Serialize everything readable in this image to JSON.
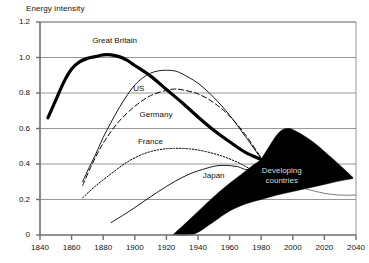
{
  "chart_data": {
    "type": "line",
    "title": "Energy intensity",
    "xlabel": "",
    "ylabel": "",
    "xlim": [
      1840,
      2040
    ],
    "ylim": [
      0,
      1.2
    ],
    "grid": true,
    "legend_position": "inline-labels",
    "xticks": [
      "1840",
      "1860",
      "1880",
      "1900",
      "1920",
      "1940",
      "1960",
      "1980",
      "2000",
      "2020",
      "2040"
    ],
    "yticks": [
      "0",
      "0.2",
      "0.4",
      "0.6",
      "0.8",
      "1.0",
      "1.2"
    ],
    "series": [
      {
        "name": "Great Britain",
        "style": "solid-thick",
        "label_x": 1873,
        "label_y": 1.095,
        "points": [
          [
            1845,
            0.66
          ],
          [
            1850,
            0.76
          ],
          [
            1855,
            0.86
          ],
          [
            1860,
            0.935
          ],
          [
            1865,
            0.975
          ],
          [
            1870,
            0.995
          ],
          [
            1875,
            1.005
          ],
          [
            1880,
            1.015
          ],
          [
            1885,
            1.015
          ],
          [
            1890,
            1.005
          ],
          [
            1895,
            0.985
          ],
          [
            1900,
            0.955
          ],
          [
            1910,
            0.895
          ],
          [
            1920,
            0.82
          ],
          [
            1930,
            0.745
          ],
          [
            1940,
            0.665
          ],
          [
            1950,
            0.59
          ],
          [
            1960,
            0.525
          ],
          [
            1970,
            0.465
          ],
          [
            1980,
            0.425
          ]
        ]
      },
      {
        "name": "US",
        "style": "solid-thin",
        "label_x": 1899,
        "label_y": 0.825,
        "points": [
          [
            1867,
            0.3
          ],
          [
            1870,
            0.36
          ],
          [
            1875,
            0.45
          ],
          [
            1880,
            0.55
          ],
          [
            1885,
            0.635
          ],
          [
            1890,
            0.715
          ],
          [
            1895,
            0.785
          ],
          [
            1900,
            0.845
          ],
          [
            1905,
            0.885
          ],
          [
            1910,
            0.912
          ],
          [
            1915,
            0.925
          ],
          [
            1920,
            0.928
          ],
          [
            1925,
            0.925
          ],
          [
            1930,
            0.908
          ],
          [
            1940,
            0.855
          ],
          [
            1950,
            0.775
          ],
          [
            1960,
            0.675
          ],
          [
            1970,
            0.555
          ],
          [
            1980,
            0.43
          ]
        ]
      },
      {
        "name": "Germany",
        "style": "dashed",
        "label_x": 1903,
        "label_y": 0.675,
        "points": [
          [
            1867,
            0.28
          ],
          [
            1872,
            0.38
          ],
          [
            1877,
            0.47
          ],
          [
            1882,
            0.545
          ],
          [
            1890,
            0.64
          ],
          [
            1900,
            0.725
          ],
          [
            1910,
            0.785
          ],
          [
            1920,
            0.815
          ],
          [
            1925,
            0.822
          ],
          [
            1930,
            0.818
          ],
          [
            1940,
            0.795
          ],
          [
            1950,
            0.745
          ],
          [
            1960,
            0.67
          ],
          [
            1970,
            0.565
          ],
          [
            1980,
            0.435
          ]
        ]
      },
      {
        "name": "France",
        "style": "dotted",
        "label_x": 1902,
        "label_y": 0.525,
        "points": [
          [
            1867,
            0.21
          ],
          [
            1875,
            0.275
          ],
          [
            1885,
            0.345
          ],
          [
            1895,
            0.41
          ],
          [
            1905,
            0.455
          ],
          [
            1915,
            0.48
          ],
          [
            1925,
            0.488
          ],
          [
            1935,
            0.485
          ],
          [
            1945,
            0.47
          ],
          [
            1955,
            0.445
          ],
          [
            1965,
            0.41
          ],
          [
            1975,
            0.37
          ],
          [
            1980,
            0.42
          ]
        ]
      },
      {
        "name": "Japan",
        "style": "solid-thin",
        "label_x": 1943,
        "label_y": 0.335,
        "points": [
          [
            1885,
            0.07
          ],
          [
            1895,
            0.125
          ],
          [
            1905,
            0.185
          ],
          [
            1915,
            0.245
          ],
          [
            1925,
            0.3
          ],
          [
            1935,
            0.345
          ],
          [
            1945,
            0.375
          ],
          [
            1952,
            0.39
          ],
          [
            1958,
            0.392
          ],
          [
            1965,
            0.385
          ],
          [
            1972,
            0.37
          ],
          [
            1980,
            0.425
          ]
        ]
      }
    ],
    "band": {
      "name": "Developing countries",
      "label_lines": [
        "Developing",
        "countries"
      ],
      "label_x": 1993,
      "label_y": 0.33,
      "fill": "#000000",
      "upper": [
        [
          1924,
          0.0
        ],
        [
          1935,
          0.09
        ],
        [
          1945,
          0.175
        ],
        [
          1955,
          0.255
        ],
        [
          1965,
          0.325
        ],
        [
          1975,
          0.395
        ],
        [
          1980,
          0.43
        ],
        [
          1990,
          0.565
        ],
        [
          1996,
          0.6
        ],
        [
          2002,
          0.585
        ],
        [
          2012,
          0.53
        ],
        [
          2022,
          0.455
        ],
        [
          2032,
          0.375
        ],
        [
          2038,
          0.325
        ]
      ],
      "lower": [
        [
          1924,
          0.0
        ],
        [
          1934,
          0.0
        ],
        [
          1940,
          0.015
        ],
        [
          1950,
          0.075
        ],
        [
          1960,
          0.135
        ],
        [
          1970,
          0.175
        ],
        [
          1980,
          0.2
        ],
        [
          1990,
          0.225
        ],
        [
          2000,
          0.245
        ],
        [
          2010,
          0.265
        ],
        [
          2020,
          0.285
        ],
        [
          2030,
          0.305
        ],
        [
          2038,
          0.318
        ]
      ]
    },
    "extra_curve": {
      "name": "developing-lower-tail",
      "points": [
        [
          2008,
          0.26
        ],
        [
          2020,
          0.235
        ],
        [
          2030,
          0.225
        ],
        [
          2040,
          0.225
        ]
      ]
    }
  }
}
